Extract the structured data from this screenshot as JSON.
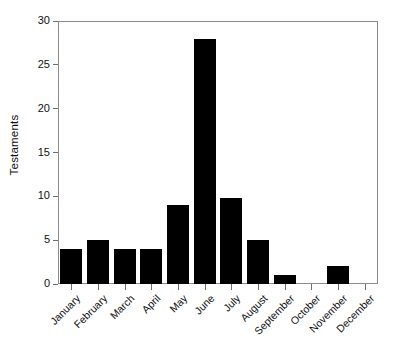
{
  "chart_data": {
    "type": "bar",
    "title": "",
    "xlabel": "",
    "ylabel": "Testaments",
    "categories": [
      "January",
      "February",
      "March",
      "April",
      "May",
      "June",
      "July",
      "August",
      "September",
      "October",
      "November",
      "December"
    ],
    "values": [
      4,
      5,
      4,
      4,
      9,
      28,
      9.8,
      5,
      1,
      0,
      2,
      0
    ],
    "ylim": [
      0,
      30
    ],
    "yticks": [
      0,
      5,
      10,
      15,
      20,
      25,
      30
    ],
    "ytick_labels": [
      "0",
      "5",
      "10",
      "15",
      "20",
      "25",
      "30"
    ],
    "grid": false,
    "legend": null,
    "bar_color": "#000000",
    "frame_color": "#8b8b8b",
    "background": "#ffffff",
    "xtick_label_rotation": -45
  }
}
